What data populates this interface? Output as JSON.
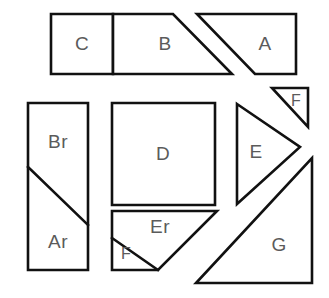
{
  "diagram": {
    "canvas": {
      "width": 329,
      "height": 298
    },
    "style": {
      "background_color": "#ffffff",
      "stroke_color": "#111111",
      "fill_color": "#ffffff",
      "label_color": "#5b5b5b",
      "stroke_width": 2.6
    },
    "pieces": [
      {
        "id": "C",
        "label": "C",
        "shape": "rectangle",
        "points": "51,14 113,14 113,74 51,74",
        "label_x": 82,
        "label_y": 45
      },
      {
        "id": "B",
        "label": "B",
        "shape": "trapezoid",
        "points": "113,14 173,14 232,74 113,74",
        "label_x": 165,
        "label_y": 45
      },
      {
        "id": "A",
        "label": "A",
        "shape": "trapezoid",
        "points": "197,14 296,14 296,74 255,74",
        "label_x": 265,
        "label_y": 45
      },
      {
        "id": "F-top",
        "label": "F",
        "shape": "right-triangle",
        "points": "272,88 308,88 308,127",
        "label_x": 296,
        "label_y": 102,
        "small": true
      },
      {
        "id": "Br-Ar",
        "label": "",
        "shape": "rectangle",
        "points": "28,103 88,103 88,270 28,270",
        "label_x": 58,
        "label_y": 186
      },
      {
        "id": "D",
        "label": "D",
        "shape": "square",
        "points": "112,103 215,103 215,205 112,205",
        "label_x": 163,
        "label_y": 155
      },
      {
        "id": "Er",
        "label": "Er",
        "shape": "trapezoid",
        "points": "112,211 217,211 158,270 112,270",
        "label_x": 160,
        "label_y": 228
      },
      {
        "id": "E",
        "label": "E",
        "shape": "triangle",
        "points": "237,104 300,147 237,204",
        "label_x": 256,
        "label_y": 153
      },
      {
        "id": "G",
        "label": "G",
        "shape": "right-triangle",
        "points": "312,158 312,283 196,283",
        "label_x": 279,
        "label_y": 246
      }
    ],
    "sub_labels": [
      {
        "id": "Br",
        "label": "Br",
        "label_x": 58,
        "label_y": 143
      },
      {
        "id": "Ar",
        "label": "Ar",
        "label_x": 58,
        "label_y": 243
      },
      {
        "id": "F-bottom",
        "label": "F",
        "label_x": 126,
        "label_y": 255,
        "small": true
      }
    ],
    "divider_lines": [
      {
        "id": "br-ar-diagonal",
        "x1": 28,
        "y1": 167,
        "x2": 88,
        "y2": 225
      },
      {
        "id": "er-f-diagonal",
        "x1": 112,
        "y1": 238,
        "x2": 158,
        "y2": 270
      }
    ]
  }
}
